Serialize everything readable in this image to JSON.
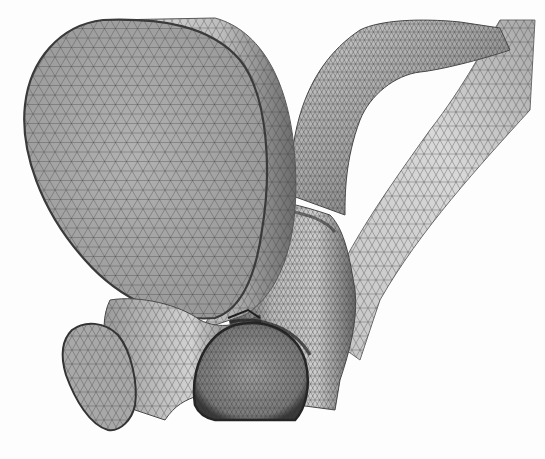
{
  "figure": {
    "subject": "3D triangulated surface mesh of branching vessel geometry",
    "rendering": "grayscale finite-element surface mesh",
    "colors": {
      "background": "#fdfdfd",
      "surface_light": "#d4d4d4",
      "surface_mid": "#a9a9a9",
      "surface_dark": "#5e5e5e",
      "mesh_line": "#3c3c3c",
      "outline": "#2a2a2a"
    },
    "parts": [
      {
        "id": "large-inlet-cap",
        "label": "large circular inlet face"
      },
      {
        "id": "upper-arch-branch",
        "label": "upper curved branch"
      },
      {
        "id": "right-long-branch",
        "label": "long right branch"
      },
      {
        "id": "central-junction",
        "label": "central bifurcation"
      },
      {
        "id": "small-left-outlet",
        "label": "small left outlet face"
      },
      {
        "id": "lower-outlet",
        "label": "lower circular outlet face"
      }
    ]
  }
}
